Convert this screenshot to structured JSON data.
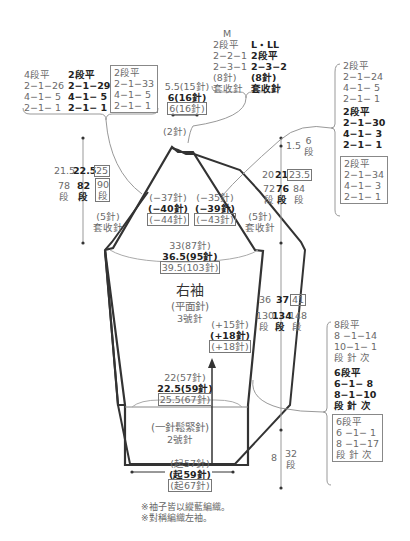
{
  "diagram": {
    "piece_title": "右袖",
    "stitch": "(平面針)",
    "needle_main": "3號針",
    "ribbing": "(一針鬆緊針)",
    "needle_rib": "2號針",
    "notes": [
      "※袖子皆以縱藍編織。",
      "※對稱編織左袖。"
    ]
  },
  "top_left_decrease": {
    "columns": [
      {
        "style": "normal",
        "lines": [
          "4段平",
          "2−1−26",
          "4−1− 5",
          "2−1− 1"
        ]
      },
      {
        "style": "bold",
        "lines": [
          "2段平",
          "2−1−29",
          "4−1− 5",
          "2−1− 1"
        ]
      },
      {
        "style": "boxed",
        "lines": [
          "2段平",
          "2−1−33",
          "4−1− 5",
          "2−1− 1"
        ]
      }
    ]
  },
  "top_width": {
    "normal": "5.5(15針)",
    "bold": "6(16針)",
    "boxed": "6(16針)"
  },
  "top_bindoff": {
    "M": {
      "label": "M",
      "lines": [
        "2段平",
        "2−2−1",
        "2−3−1",
        "(8針)",
        "套收針"
      ]
    },
    "L_LL": {
      "label": "L・LL",
      "lines": [
        "2段平",
        "2−3−2",
        "(8針)",
        "套收針"
      ]
    }
  },
  "peak_label": "(2針)",
  "right_decrease": {
    "normal": [
      "2段平",
      "2−1−24",
      "4−1− 5",
      "2−1− 1"
    ],
    "bold": [
      "2段平",
      "2−1−30",
      "4−1− 3",
      "2−1− 1"
    ],
    "boxed": [
      "2段平",
      "2−1−34",
      "4−1− 3",
      "2−1− 1"
    ]
  },
  "left_cap_height": {
    "normal": "21.5",
    "bold": "22.5",
    "boxed": "25",
    "rows_normal": "78段",
    "rows_bold": "82段",
    "rows_boxed": "90段"
  },
  "right_top_height": {
    "value": "1.5",
    "rows": "6段"
  },
  "right_cap_height": {
    "normal": "20",
    "bold": "21",
    "boxed": "23.5",
    "rows_normal": "72段",
    "rows_bold": "76段",
    "rows_boxed": "84段"
  },
  "cap_decrease_left": {
    "normal": "(−37針)",
    "bold": "(−40針)",
    "boxed": "(−44針)"
  },
  "cap_decrease_right": {
    "normal": "(−35針)",
    "bold": "(−39針)",
    "boxed": "(−43針)"
  },
  "bindoff_left": {
    "count": "(5針)",
    "label": "套收針"
  },
  "bindoff_right": {
    "count": "(5針)",
    "label": "套收針"
  },
  "upper_width": {
    "normal": "33(87針)",
    "bold": "36.5(95針)",
    "boxed": "39.5(103針)"
  },
  "increase": {
    "normal": "(+15針)",
    "bold": "(+18針)",
    "boxed": "(+18針)"
  },
  "body_height": {
    "normal": "36",
    "bold": "37",
    "boxed": "41",
    "rows_normal": "130段",
    "rows_bold": "134段",
    "rows_boxed": "148段"
  },
  "increase_schedule": {
    "normal": [
      "8段平",
      "8 −1−14",
      "10−1− 1",
      "段 針 次"
    ],
    "bold": [
      "6段平",
      "6−1− 8",
      "8−1−10",
      "段 針 次"
    ],
    "boxed": [
      "6段平",
      "6 −1− 1",
      "8 −1−17",
      "段 針 次"
    ]
  },
  "cuff_width": {
    "normal": "22(57針)",
    "bold": "22.5(59針)",
    "boxed": "25.5(67針)"
  },
  "cuff_height": {
    "value": "8",
    "rows": "32段"
  },
  "cast_on": {
    "normal": "(起57針)",
    "bold": "(起59針)",
    "boxed": "(起67針)"
  },
  "colors": {
    "outline": "#333333",
    "text": "#6a6a6a",
    "bold_text": "#222222",
    "leader": "#999999"
  }
}
